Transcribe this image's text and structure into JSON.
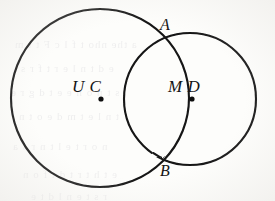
{
  "figure": {
    "type": "two-intersecting-circles-venn",
    "canvas": {
      "width": 275,
      "height": 201
    },
    "background_color": "#fdfdfb",
    "stroke_color": "#141414",
    "circles": [
      {
        "id": "left-circle",
        "name": "circle-U-C",
        "center_label": "U C",
        "center_x": 100,
        "center_y": 98,
        "radius": 89,
        "stroke_width": 2.1
      },
      {
        "id": "right-circle",
        "name": "circle-M-D",
        "center_label": "M D",
        "center_x": 190,
        "center_y": 99,
        "radius": 66,
        "stroke_width": 2.1
      }
    ],
    "center_points": [
      {
        "name": "left-center-dot",
        "x": 101,
        "y": 99,
        "r": 2.6
      },
      {
        "name": "right-center-dot",
        "x": 192,
        "y": 99,
        "r": 2.6
      }
    ],
    "intersection_points": [
      {
        "name": "point-A",
        "label": "A",
        "x": 163,
        "y": 40,
        "label_x": 160,
        "label_y": 17
      },
      {
        "name": "point-B",
        "label": "B",
        "x": 164,
        "y": 158,
        "label_x": 160,
        "label_y": 163
      }
    ],
    "labels": {
      "left_center": "U C",
      "left_center_x": 72,
      "left_center_y": 78,
      "right_center": "M D",
      "right_center_x": 168,
      "right_center_y": 78,
      "point_a": "A",
      "point_b": "B"
    }
  },
  "bleed_through": {
    "note": "faint mirrored ghost text from reverse side of scanned page",
    "lines": [
      {
        "text": "a the  nho  t f l c F t  t m",
        "x": 14,
        "y": 38
      },
      {
        "text": "e  d  t  n  l  e r  t f r  s",
        "x": 20,
        "y": 62
      },
      {
        "text": "s  t n  o  n e  e  t  d g r e",
        "x": 10,
        "y": 86
      },
      {
        "text": "t  n l e  t  m  d  e o t  n",
        "x": 18,
        "y": 110
      },
      {
        "text": "n o  r  t  e  l  t  n  r  s  a",
        "x": 12,
        "y": 140
      },
      {
        "text": "e  t  h  t r  t  d  t f  o  n",
        "x": 22,
        "y": 168
      },
      {
        "text": "r  s  t  e  n  l  d  t  e",
        "x": 30,
        "y": 190
      }
    ]
  }
}
